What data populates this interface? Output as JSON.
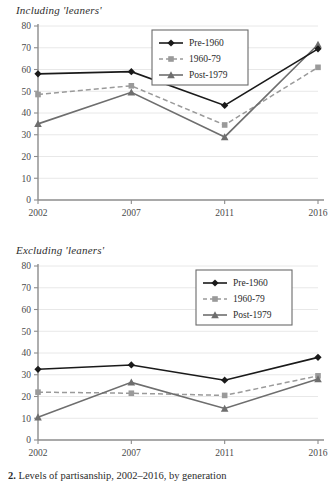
{
  "figure": {
    "caption_number": "2.",
    "caption_text": "Levels of partisanship, 2002–2016, by generation"
  },
  "series_style": {
    "pre1960": {
      "color": "#1a1a1a",
      "marker": "diamond",
      "dash": "solid"
    },
    "g196079": {
      "color": "#9a9a9a",
      "marker": "square",
      "dash": "dashed"
    },
    "post1979": {
      "color": "#6e6e6e",
      "marker": "triangle",
      "dash": "solid"
    }
  },
  "chart_data": [
    {
      "type": "line",
      "id": "including-leaners",
      "title": "Including 'leaners'",
      "xlabel": "",
      "ylabel": "",
      "categories": [
        "2002",
        "2007",
        "2011",
        "2016"
      ],
      "yticks": [
        0,
        10,
        20,
        30,
        40,
        50,
        60,
        70,
        80
      ],
      "ylim": [
        0,
        80
      ],
      "grid": true,
      "legend_position": "top-center",
      "series": [
        {
          "name": "Pre-1960",
          "values": [
            58,
            59,
            43.5,
            69.5
          ]
        },
        {
          "name": "1960-79",
          "values": [
            48.5,
            52.5,
            34.5,
            61
          ]
        },
        {
          "name": "Post-1979",
          "values": [
            35,
            49.5,
            29,
            71.5
          ]
        }
      ]
    },
    {
      "type": "line",
      "id": "excluding-leaners",
      "title": "Excluding 'leaners'",
      "xlabel": "",
      "ylabel": "",
      "categories": [
        "2002",
        "2007",
        "2011",
        "2016"
      ],
      "yticks": [
        0,
        10,
        20,
        30,
        40,
        50,
        60,
        70,
        80
      ],
      "ylim": [
        0,
        80
      ],
      "grid": true,
      "legend_position": "top-right",
      "series": [
        {
          "name": "Pre-1960",
          "values": [
            32.5,
            34.5,
            27.5,
            38
          ]
        },
        {
          "name": "1960-79",
          "values": [
            22,
            21.5,
            20.5,
            29.5
          ]
        },
        {
          "name": "Post-1979",
          "values": [
            10.5,
            26.5,
            14.5,
            28
          ]
        }
      ]
    }
  ]
}
